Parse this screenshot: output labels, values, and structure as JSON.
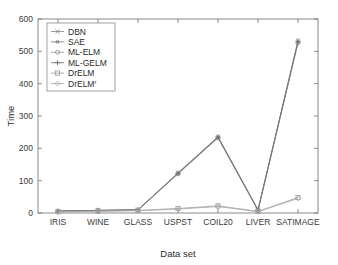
{
  "chart_data": {
    "type": "line",
    "title": "",
    "xlabel": "Data set",
    "ylabel": "Time",
    "categories": [
      "IRIS",
      "WINE",
      "GLASS",
      "USPST",
      "COIL20",
      "LIVER",
      "SATIMAGE"
    ],
    "ylim": [
      0,
      600
    ],
    "yticks": [
      0,
      100,
      200,
      300,
      400,
      500,
      600
    ],
    "grid": false,
    "legend_position": "upper-left-inside",
    "series": [
      {
        "name": "DBN",
        "marker": "x",
        "color": "#8a8a8a",
        "values": [
          6,
          8,
          10,
          124,
          236,
          10,
          533
        ]
      },
      {
        "name": "SAE",
        "marker": "star",
        "color": "#7d7d7d",
        "values": [
          6,
          8,
          10,
          122,
          233,
          9,
          528
        ]
      },
      {
        "name": "ML-ELM",
        "marker": "circle",
        "color": "#9a9a9a",
        "values": [
          5,
          7,
          9,
          121,
          232,
          8,
          526
        ]
      },
      {
        "name": "ML-GELM",
        "marker": "plus",
        "color": "#6f6f6f",
        "values": [
          6,
          8,
          10,
          123,
          235,
          9,
          531
        ]
      },
      {
        "name": "DrELM",
        "marker": "square",
        "color": "#a0a0a0",
        "values": [
          4,
          6,
          8,
          14,
          22,
          5,
          48
        ]
      },
      {
        "name": "DrELM'",
        "marker": "diamond",
        "color": "#ababab",
        "values": [
          3,
          5,
          7,
          12,
          20,
          4,
          45
        ]
      }
    ],
    "legend_entries": [
      {
        "label": "DBN",
        "marker": "x"
      },
      {
        "label": "SAE",
        "marker": "star"
      },
      {
        "label": "ML-ELM",
        "marker": "circle"
      },
      {
        "label": "ML-GELM",
        "marker": "plus"
      },
      {
        "label": "DrELM",
        "marker": "square"
      },
      {
        "label": "DrELM",
        "label_sup": "r",
        "marker": "diamond"
      }
    ]
  },
  "axis": {
    "y_ticks": [
      "0",
      "100",
      "200",
      "300",
      "400",
      "500",
      "600"
    ],
    "x_ticks": [
      "IRIS",
      "WINE",
      "GLASS",
      "USPST",
      "COIL20",
      "LIVER",
      "SATIMAGE"
    ],
    "y_title": "Time",
    "x_title": "Data set"
  }
}
